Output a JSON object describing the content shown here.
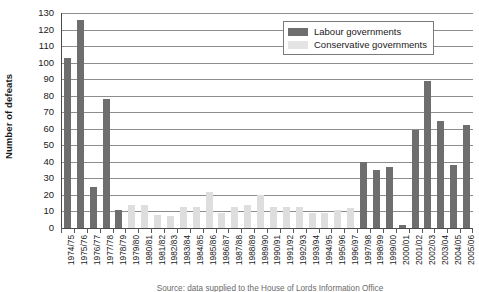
{
  "chart_data": {
    "type": "bar",
    "title": "",
    "xlabel": "",
    "ylabel": "Number of defeats",
    "ylim": [
      0,
      130
    ],
    "ytick_step": 10,
    "yticks": [
      0,
      10,
      20,
      30,
      40,
      50,
      60,
      70,
      80,
      90,
      100,
      110,
      120,
      130
    ],
    "grid": true,
    "legend_position": "top-right",
    "categories": [
      "1974/75",
      "1975/76",
      "1976/77",
      "1977/78",
      "1978/79",
      "1979/80",
      "1980/81",
      "1981/82",
      "1982/83",
      "1983/84",
      "1984/85",
      "1985/86",
      "1986/87",
      "1987/88",
      "1988/89",
      "1989/90",
      "1990/91",
      "1991/92",
      "1992/93",
      "1993/94",
      "1994/95",
      "1995/96",
      "1996/97",
      "1997/98",
      "1998/99",
      "1999/00",
      "2000/01",
      "2001/02",
      "2002/03",
      "2003/04",
      "2004/05",
      "2005/06"
    ],
    "series": [
      {
        "name": "Labour governments",
        "color": "#6e6e6e",
        "values": [
          103,
          126,
          25,
          78,
          11,
          null,
          null,
          null,
          null,
          null,
          null,
          null,
          null,
          null,
          null,
          null,
          null,
          null,
          null,
          null,
          null,
          null,
          null,
          40,
          35,
          37,
          2,
          59,
          89,
          65,
          38,
          62
        ]
      },
      {
        "name": "Conservative governments",
        "color": "#dedede",
        "values": [
          null,
          null,
          null,
          null,
          null,
          14,
          14,
          8,
          7,
          13,
          13,
          22,
          9,
          13,
          14,
          20,
          13,
          13,
          13,
          9,
          9,
          11,
          12,
          null,
          null,
          null,
          null,
          null,
          null,
          null,
          null,
          null
        ]
      }
    ],
    "legend": [
      {
        "label": "Labour governments",
        "swatch": "lab"
      },
      {
        "label": "Conservative governments",
        "swatch": "con"
      }
    ],
    "source_caption": "Source: data supplied to the House of Lords Information Office"
  },
  "colors": {
    "labour": "#6e6e6e",
    "conservative": "#dedede",
    "gridline": "#8d8d8d",
    "axis": "#4a4a4a"
  }
}
